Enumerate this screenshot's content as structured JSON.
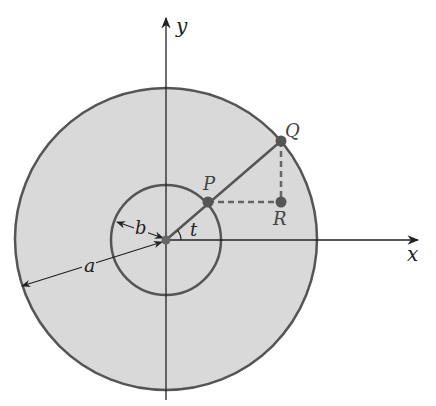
{
  "figure": {
    "labels": {
      "y_axis": "y",
      "x_axis": "x",
      "point_p": "P",
      "point_q": "Q",
      "point_r": "R",
      "radius_a": "a",
      "radius_b": "b",
      "angle_t": "t"
    },
    "colors": {
      "disk_fill": "#d9d9d9",
      "circle_stroke": "#555555",
      "axis_stroke": "#222222",
      "point_fill": "#555555",
      "dashed_stroke": "#666666"
    },
    "geometry": {
      "origin": [
        166,
        240
      ],
      "outer_radius_px": 151,
      "inner_radius_px": 55,
      "angle_t_deg": 40,
      "P": [
        208,
        202
      ],
      "Q": [
        281,
        141
      ],
      "R": [
        281,
        202
      ]
    }
  }
}
